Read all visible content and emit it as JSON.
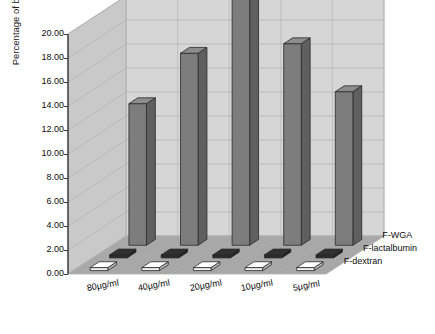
{
  "chart_data": {
    "type": "bar",
    "title": "",
    "xlabel": "",
    "ylabel": "Percentage of binding",
    "ylim": [
      0,
      20
    ],
    "ytick_step": 2,
    "yticks": [
      "0.00",
      "2.00",
      "4.00",
      "6.00",
      "8.00",
      "10.00",
      "12.00",
      "14.00",
      "16.00",
      "18.00",
      "20.00"
    ],
    "categories": [
      "80µg/ml",
      "40µg/ml",
      "20µg/ml",
      "10µg/ml",
      "5µg/ml"
    ],
    "grid": true,
    "projection": "3d",
    "legend_position": "right",
    "series": [
      {
        "name": "F-WGA",
        "values": [
          11.8,
          16.0,
          20.5,
          16.8,
          12.8
        ],
        "color": "#7d7d7d"
      },
      {
        "name": "F-lactalbumin",
        "values": [
          0.25,
          0.25,
          0.25,
          0.25,
          0.25
        ],
        "color": "#2b2b2b"
      },
      {
        "name": "F-dextran",
        "values": [
          0.25,
          0.25,
          0.25,
          0.25,
          0.25
        ],
        "color": "#f2f2f2"
      }
    ]
  },
  "legend": {
    "items": [
      {
        "label": "F-WGA"
      },
      {
        "label": "F-lactalbumin"
      },
      {
        "label": "F-dextran"
      }
    ]
  },
  "colors": {
    "back_wall": "#d6d6d6",
    "side_wall": "#c9c9c9",
    "floor": "#a8a8a8",
    "grid_line": "#b0b0b0",
    "bar_front": "#7d7d7d",
    "bar_side": "#5e5e5e",
    "bar_top": "#8d8d8d",
    "outline": "#2a2a2a"
  }
}
